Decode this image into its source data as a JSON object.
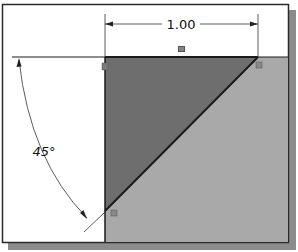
{
  "diagram": {
    "type": "cad-sketch",
    "dimensions": {
      "linear": {
        "label": "1.00"
      },
      "angular": {
        "label": "45°"
      }
    },
    "relations": {
      "horizontal_marker": "equal-icon",
      "vertex_markers": [
        "fix-marker-top-left",
        "fix-marker-top-right",
        "fix-marker-bottom"
      ]
    },
    "colors": {
      "frame_border": "#2a2a2a",
      "frame_shadow": "#8c8c8c",
      "background": "#ffffff",
      "gray_region": "#a9a9a9",
      "triangle_fill": "#6e6e6e",
      "line": "#1a1a1a",
      "dimension_line": "#333333"
    }
  }
}
